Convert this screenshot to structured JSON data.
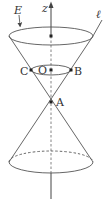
{
  "figure": {
    "type": "double-cone",
    "stroke_color": "#555555",
    "labels": {
      "axis": "z",
      "surface": "E",
      "line": "ℓ",
      "origin": "O",
      "apex": "A",
      "point_b": "B",
      "point_c": "C"
    },
    "points": [
      {
        "name": "top-center",
        "x": 51,
        "y": 36
      },
      {
        "name": "O",
        "x": 51,
        "y": 70
      },
      {
        "name": "B",
        "x": 71,
        "y": 70
      },
      {
        "name": "C",
        "x": 31,
        "y": 70
      },
      {
        "name": "A",
        "x": 51,
        "y": 102
      }
    ]
  }
}
